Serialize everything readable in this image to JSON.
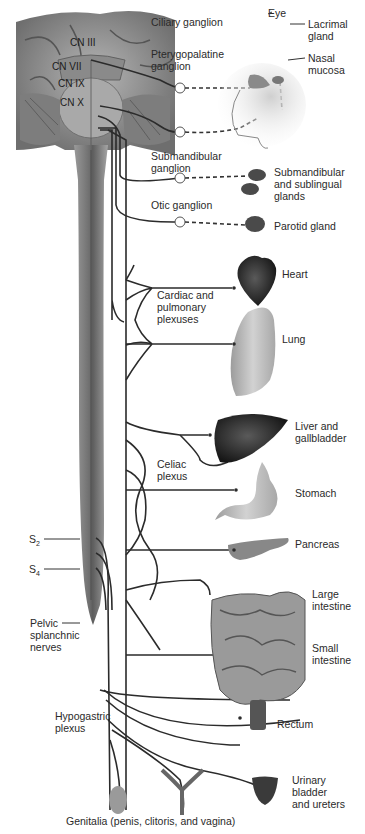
{
  "diagram": {
    "colors": {
      "nerve": "#2b2b2b",
      "brain": "#8c8c8c",
      "spinal_cord": "#7a7a7a",
      "organ_dark": "#2e2e2e",
      "organ_light": "#bcbcbc",
      "label": "#2a2a2a"
    },
    "cranial_nerves": [
      {
        "id": "cn3",
        "label": "CN III"
      },
      {
        "id": "cn7",
        "label": "CN VII"
      },
      {
        "id": "cn9",
        "label": "CN IX"
      },
      {
        "id": "cn10",
        "label": "CN X"
      }
    ],
    "ganglia": [
      {
        "id": "ciliary",
        "label": "Ciliary ganglion"
      },
      {
        "id": "pterygopalatine",
        "label": "Pterygopalatine\nganglion"
      },
      {
        "id": "submandibular",
        "label": "Submandibular\nganglion"
      },
      {
        "id": "otic",
        "label": "Otic ganglion"
      }
    ],
    "plexuses": [
      {
        "id": "cardiac",
        "label": "Cardiac and\npulmonary\nplexuses"
      },
      {
        "id": "celiac",
        "label": "Celiac\nplexus"
      },
      {
        "id": "hypogastric",
        "label": "Hypogastric\nplexus"
      }
    ],
    "spinal": {
      "s2": {
        "letter": "S",
        "sub": "2"
      },
      "s4": {
        "letter": "S",
        "sub": "4"
      },
      "pelvic_nerves": "Pelvic\nsplanchnic\nnerves"
    },
    "organs": [
      {
        "id": "eye",
        "label": "Eye"
      },
      {
        "id": "lacrimal",
        "label": "Lacrimal\ngland"
      },
      {
        "id": "nasal",
        "label": "Nasal\nmucosa"
      },
      {
        "id": "submandibular_glands",
        "label": "Submandibular\nand sublingual\nglands"
      },
      {
        "id": "parotid",
        "label": "Parotid gland"
      },
      {
        "id": "heart",
        "label": "Heart"
      },
      {
        "id": "lung",
        "label": "Lung"
      },
      {
        "id": "liver",
        "label": "Liver and\ngallbladder"
      },
      {
        "id": "stomach",
        "label": "Stomach"
      },
      {
        "id": "pancreas",
        "label": "Pancreas"
      },
      {
        "id": "large_intestine",
        "label": "Large\nintestine"
      },
      {
        "id": "small_intestine",
        "label": "Small\nintestine"
      },
      {
        "id": "rectum",
        "label": "Rectum"
      },
      {
        "id": "bladder",
        "label": "Urinary\nbladder\nand ureters"
      },
      {
        "id": "genitalia",
        "label": "Genitalia (penis, clitoris, and vagina)"
      }
    ]
  }
}
